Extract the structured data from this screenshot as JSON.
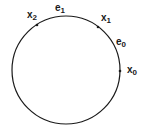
{
  "diagram": {
    "type": "circle-with-labeled-points",
    "stroke_color": "#1a1a1a",
    "labels": [
      {
        "id": "x2",
        "base": "x",
        "sub": "2"
      },
      {
        "id": "e1",
        "base": "e",
        "sub": "1"
      },
      {
        "id": "x1",
        "base": "x",
        "sub": "1"
      },
      {
        "id": "e0",
        "base": "e",
        "sub": "0"
      },
      {
        "id": "x0",
        "base": "x",
        "sub": "0"
      }
    ],
    "points": [
      "x2",
      "x1",
      "x0"
    ]
  }
}
